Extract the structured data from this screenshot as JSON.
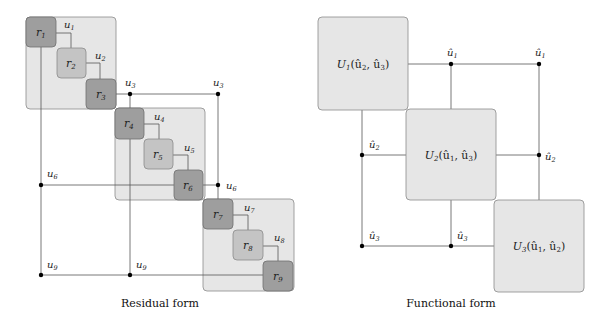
{
  "residual": {
    "caption": "Residual form",
    "blocks": [
      {
        "x": 26,
        "y": 17,
        "w": 90,
        "h": 92
      },
      {
        "x": 115,
        "y": 108,
        "w": 90,
        "h": 92
      },
      {
        "x": 203,
        "y": 199,
        "w": 91,
        "h": 92
      }
    ],
    "residuals": [
      {
        "label": "r",
        "sub": "1",
        "x": 26,
        "y": 17,
        "shade": "dark"
      },
      {
        "label": "r",
        "sub": "2",
        "x": 57,
        "y": 48,
        "shade": "light"
      },
      {
        "label": "r",
        "sub": "3",
        "x": 86,
        "y": 79,
        "shade": "dark"
      },
      {
        "label": "r",
        "sub": "4",
        "x": 115,
        "y": 108,
        "shade": "dark"
      },
      {
        "label": "r",
        "sub": "5",
        "x": 144,
        "y": 139,
        "shade": "light"
      },
      {
        "label": "r",
        "sub": "6",
        "x": 174,
        "y": 170,
        "shade": "dark"
      },
      {
        "label": "r",
        "sub": "7",
        "x": 203,
        "y": 199,
        "shade": "dark"
      },
      {
        "label": "r",
        "sub": "8",
        "x": 233,
        "y": 230,
        "shade": "light"
      },
      {
        "label": "r",
        "sub": "9",
        "x": 263,
        "y": 261,
        "shade": "dark"
      }
    ],
    "variables": [
      {
        "label": "u",
        "sub": "1",
        "x": 64,
        "y": 28
      },
      {
        "label": "u",
        "sub": "2",
        "x": 95,
        "y": 59
      },
      {
        "label": "u",
        "sub": "3",
        "x": 125,
        "y": 86
      },
      {
        "label": "u",
        "sub": "3",
        "x": 213,
        "y": 86
      },
      {
        "label": "u",
        "sub": "4",
        "x": 154,
        "y": 120
      },
      {
        "label": "u",
        "sub": "5",
        "x": 184,
        "y": 150
      },
      {
        "label": "u",
        "sub": "6",
        "x": 47,
        "y": 177
      },
      {
        "label": "u",
        "sub": "6",
        "x": 226,
        "y": 189
      },
      {
        "label": "u",
        "sub": "7",
        "x": 244,
        "y": 211
      },
      {
        "label": "u",
        "sub": "8",
        "x": 274,
        "y": 241
      },
      {
        "label": "u",
        "sub": "9",
        "x": 47,
        "y": 268
      },
      {
        "label": "u",
        "sub": "9",
        "x": 136,
        "y": 268
      }
    ]
  },
  "functional": {
    "caption": "Functional form",
    "blocks": [
      {
        "label": "U",
        "sub": "1",
        "args": "(û",
        "a1": "2",
        "mid": ", û",
        "a2": "3",
        "end": ")",
        "x": 318,
        "y": 17,
        "w": 90,
        "h": 93
      },
      {
        "label": "U",
        "sub": "2",
        "args": "(û",
        "a1": "1",
        "mid": ", û",
        "a2": "3",
        "end": ")",
        "x": 406,
        "y": 109,
        "w": 90,
        "h": 91
      },
      {
        "label": "U",
        "sub": "3",
        "args": "(û",
        "a1": "1",
        "mid": ", û",
        "a2": "2",
        "end": ")",
        "x": 494,
        "y": 200,
        "w": 90,
        "h": 92
      }
    ],
    "variables": [
      {
        "label": "û",
        "sub": "1",
        "x": 447,
        "y": 56
      },
      {
        "label": "û",
        "sub": "1",
        "x": 535,
        "y": 56
      },
      {
        "label": "û",
        "sub": "2",
        "x": 369,
        "y": 148
      },
      {
        "label": "û",
        "sub": "2",
        "x": 545,
        "y": 160
      },
      {
        "label": "û",
        "sub": "3",
        "x": 369,
        "y": 239
      },
      {
        "label": "û",
        "sub": "3",
        "x": 457,
        "y": 239
      }
    ]
  },
  "colors": {
    "block_fill": "#e6e6e6",
    "block_stroke": "#8a8a8a",
    "dark_fill": "#9e9e9e",
    "light_fill": "#c4c4c4",
    "line": "#555555",
    "dot": "#000000"
  }
}
